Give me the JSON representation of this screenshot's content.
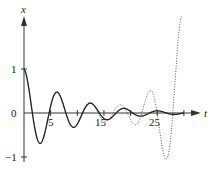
{
  "chart_data": {
    "type": "line",
    "title": "",
    "xlabel": "t",
    "ylabel": "x",
    "xlim": [
      0,
      32
    ],
    "ylim": [
      -1.1,
      2.0
    ],
    "x_ticks": [
      5,
      10,
      15,
      20,
      25,
      30
    ],
    "x_tick_labels": [
      "5",
      "",
      "15",
      "",
      "25",
      ""
    ],
    "y_ticks": [
      1,
      0,
      -1
    ],
    "y_tick_labels": [
      "1",
      "0",
      "−1"
    ],
    "grid": false,
    "legend": null,
    "series": [
      {
        "name": "solid",
        "style": "solid",
        "description": "damped oscillation x = e^(-0.12 t) cos t",
        "t_range": [
          0,
          30
        ],
        "points": [
          [
            0,
            1.0
          ],
          [
            2.9,
            -0.75
          ],
          [
            6.2,
            0.5
          ],
          [
            9.4,
            -0.35
          ],
          [
            12.5,
            0.28
          ],
          [
            15.7,
            -0.16
          ],
          [
            18.8,
            0.15
          ],
          [
            22,
            -0.09
          ],
          [
            25,
            0.1
          ],
          [
            28.2,
            -0.04
          ],
          [
            30,
            0.0
          ]
        ]
      },
      {
        "name": "dotted",
        "style": "dotted",
        "description": "follows solid curve early, then grows in amplitude",
        "t_range": [
          0,
          29.7
        ],
        "points": [
          [
            0,
            1.0
          ],
          [
            2.9,
            -0.75
          ],
          [
            6.2,
            0.5
          ],
          [
            9.4,
            -0.35
          ],
          [
            12.5,
            0.3
          ],
          [
            15.7,
            -0.2
          ],
          [
            19,
            -0.25
          ],
          [
            22,
            0.6
          ],
          [
            24.7,
            -1.0
          ],
          [
            28,
            1.64
          ],
          [
            29.7,
            -0.25
          ]
        ]
      }
    ]
  },
  "labels": {
    "x_axis": "t",
    "y_axis": "x",
    "y1": "1",
    "y0": "0",
    "yneg1": "−1",
    "t5": "5",
    "t15": "15",
    "t25": "25"
  }
}
